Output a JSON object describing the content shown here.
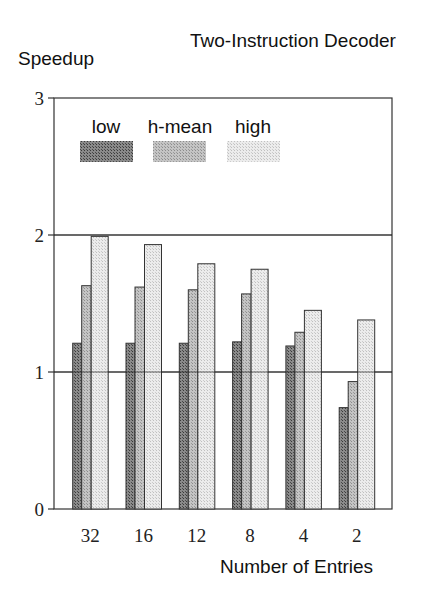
{
  "chart_data": {
    "type": "bar",
    "title": "Two-Instruction Decoder",
    "xlabel": "Number of Entries",
    "ylabel": "Speedup",
    "categories": [
      "32",
      "16",
      "12",
      "8",
      "4",
      "2"
    ],
    "series": [
      {
        "name": "low",
        "values": [
          1.21,
          1.21,
          1.21,
          1.22,
          1.19,
          0.74
        ],
        "color": "#6e6e6e"
      },
      {
        "name": "h-mean",
        "values": [
          1.63,
          1.62,
          1.6,
          1.57,
          1.29,
          0.93
        ],
        "color": "#b4b4b4"
      },
      {
        "name": "high",
        "values": [
          1.99,
          1.93,
          1.79,
          1.75,
          1.45,
          1.38
        ],
        "color": "#e0e0e0"
      }
    ],
    "ylim": [
      0,
      3
    ],
    "yticks": [
      "0",
      "1",
      "2",
      "3"
    ],
    "grid": {
      "horizontal_lines_at": [
        1,
        2
      ]
    },
    "legend_position": "top-left inside plot"
  }
}
